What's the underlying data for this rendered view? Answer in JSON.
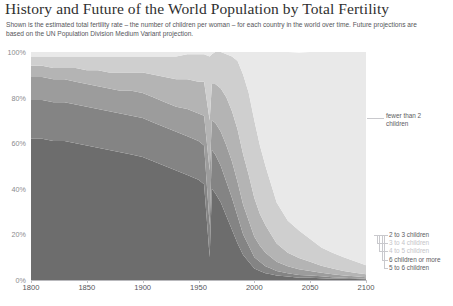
{
  "header": {
    "title": "History and Future of the World Population by Total Fertility",
    "subtitle": "Shown is the estimated total fertility rate – the number of children per woman – for each country in the world over time. Future projections are based on the UN Population Division Medium Variant projection."
  },
  "axes": {
    "y_ticks": [
      "0%",
      "20%",
      "40%",
      "60%",
      "80%",
      "100%"
    ],
    "y_values": [
      0,
      20,
      40,
      60,
      80,
      100
    ],
    "x_ticks": [
      "1800",
      "1850",
      "1900",
      "1950",
      "2000",
      "2050",
      "2100"
    ],
    "x_values": [
      1800,
      1850,
      1900,
      1950,
      2000,
      2050,
      2100
    ],
    "xlim": [
      1800,
      2100
    ],
    "ylim": [
      0,
      100
    ]
  },
  "annotations": {
    "top_right": "fewer than 2 children",
    "legend_rows": [
      {
        "label": "2 to 3 children",
        "tone": "dark"
      },
      {
        "label": "3 to 4 children",
        "tone": "faint"
      },
      {
        "label": "4 to 5 children",
        "tone": "faint"
      },
      {
        "label": "6 children or more",
        "tone": "dark"
      },
      {
        "label": "5 to 6 children",
        "tone": "dark"
      }
    ]
  },
  "colors": {
    "fewer_than_2": "#e9e9e9",
    "two_to_three": "#cfcfcf",
    "three_to_four": "#b4b4b4",
    "four_to_five": "#9c9c9c",
    "five_to_six": "#848484",
    "six_or_more": "#6d6d6d",
    "axis": "#b9b9bd",
    "text": "#3d3d3d"
  },
  "chart_data": {
    "type": "area",
    "title": "History and Future of the World Population by Total Fertility",
    "subtitle": "Shown is the estimated total fertility rate – the number of children per woman – for each country in the world over time. Future projections are based on the UN Population Division Medium Variant projection.",
    "xlabel": "",
    "ylabel": "Share of world population (%)",
    "stacked": true,
    "normalized": true,
    "xlim": [
      1800,
      2100
    ],
    "ylim": [
      0,
      100
    ],
    "grid": false,
    "legend_position": "right-inline",
    "x": [
      1800,
      1810,
      1820,
      1830,
      1840,
      1850,
      1860,
      1870,
      1880,
      1890,
      1900,
      1910,
      1920,
      1930,
      1940,
      1950,
      1955,
      1960,
      1962,
      1965,
      1970,
      1975,
      1980,
      1985,
      1990,
      1995,
      2000,
      2005,
      2010,
      2015,
      2020,
      2030,
      2040,
      2050,
      2060,
      2070,
      2080,
      2090,
      2100
    ],
    "series": [
      {
        "name": "6 children or more",
        "color": "#6d6d6d",
        "values": [
          62,
          62,
          61,
          61,
          60,
          59,
          58,
          57,
          56,
          55,
          54,
          52,
          50,
          48,
          46,
          44,
          42,
          10,
          40,
          38,
          34,
          28,
          22,
          16,
          11,
          8,
          5,
          4,
          3,
          2.5,
          2,
          1.5,
          1,
          1,
          0.8,
          0.6,
          0.5,
          0.4,
          0.3
        ]
      },
      {
        "name": "5 to 6 children",
        "color": "#848484",
        "values": [
          17,
          17,
          17,
          17,
          17,
          17,
          17,
          17,
          17,
          17,
          17,
          17,
          17,
          17,
          17,
          17,
          17,
          14,
          17,
          17,
          16,
          15,
          14,
          12,
          9,
          7,
          5,
          4,
          3,
          2.5,
          2,
          1.5,
          1.2,
          1,
          0.8,
          0.6,
          0.5,
          0.4,
          0.3
        ]
      },
      {
        "name": "4 to 5 children",
        "color": "#9c9c9c",
        "values": [
          10,
          10,
          10,
          10,
          10,
          10,
          10,
          10,
          10,
          11,
          11,
          11,
          11,
          11,
          12,
          12,
          13,
          24,
          13,
          14,
          15,
          16,
          16,
          15,
          13,
          11,
          9,
          7,
          6,
          5,
          4,
          3,
          2.5,
          2,
          1.6,
          1.3,
          1,
          0.8,
          0.6
        ]
      },
      {
        "name": "3 to 4 children",
        "color": "#b4b4b4",
        "values": [
          5,
          5,
          5,
          5,
          6,
          6,
          7,
          7,
          8,
          8,
          9,
          10,
          11,
          12,
          13,
          14,
          15,
          22,
          16,
          17,
          19,
          21,
          22,
          23,
          22,
          20,
          17,
          14,
          12,
          10,
          8,
          6,
          5,
          4,
          3,
          2.5,
          2,
          1.6,
          1.3
        ]
      },
      {
        "name": "2 to 3 children",
        "color": "#cfcfcf",
        "values": [
          4,
          4,
          5,
          5,
          5,
          6,
          6,
          7,
          7,
          7,
          7,
          8,
          9,
          10,
          11,
          12,
          12,
          28,
          13,
          14,
          16,
          19,
          24,
          30,
          35,
          36,
          34,
          30,
          26,
          22,
          18,
          14,
          12,
          10,
          8,
          7,
          6,
          5,
          4
        ]
      },
      {
        "name": "fewer than 2 children",
        "color": "#e9e9e9",
        "values": [
          2,
          2,
          2,
          2,
          2,
          2,
          2,
          2,
          2,
          2,
          2,
          2,
          2,
          2,
          1,
          1,
          1,
          2,
          1,
          0,
          0,
          1,
          2,
          4,
          10,
          18,
          30,
          41,
          50,
          58,
          66,
          74,
          78,
          82,
          85.8,
          88,
          90,
          91.8,
          93.5
        ]
      }
    ]
  }
}
